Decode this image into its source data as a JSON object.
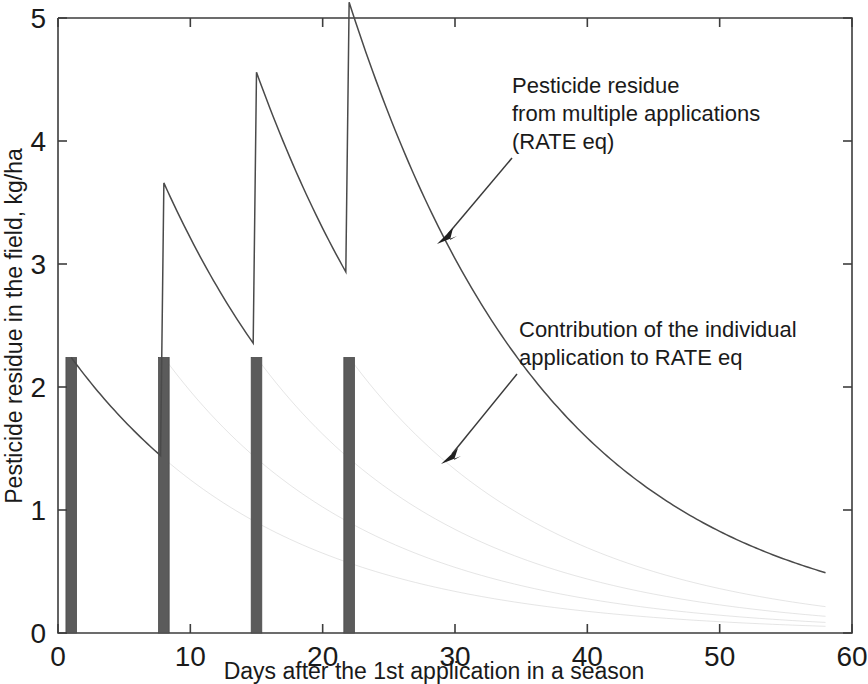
{
  "chart_data": {
    "type": "line",
    "title": "",
    "xlabel": "Days after the 1st application in a season",
    "ylabel": "Pesticide residue in the field, kg/ha",
    "xlim": [
      0,
      60
    ],
    "ylim": [
      0,
      5
    ],
    "xticks": [
      0,
      10,
      20,
      30,
      40,
      50,
      60
    ],
    "yticks": [
      0,
      1,
      2,
      3,
      4,
      5
    ],
    "grid": false,
    "legend_position": "none",
    "colors": {
      "bar": "#5b5b5b",
      "total_curve": "#4a4a4a",
      "contribution_curve": "#c9c9c9",
      "axis": "#3d3d3d",
      "text": "#1a1a1a"
    },
    "series": [
      {
        "name": "Pesticide residue from multiple applications (RATE eq)",
        "type": "line",
        "style": "solid",
        "decay_rate_per_day": 0.0652,
        "application_days": [
          1,
          8,
          15,
          22
        ],
        "application_amount": 2.24,
        "breakpoints": [
          {
            "x": 1,
            "y": 2.24,
            "label": "1st application peak"
          },
          {
            "x": 8,
            "y": 1.42,
            "label": "before 2nd application"
          },
          {
            "x": 8,
            "y": 3.55,
            "label": "2nd application peak"
          },
          {
            "x": 15,
            "y": 2.3,
            "label": "before 3rd application"
          },
          {
            "x": 15,
            "y": 4.33,
            "label": "3rd application peak"
          },
          {
            "x": 22,
            "y": 2.79,
            "label": "before 4th application"
          },
          {
            "x": 22,
            "y": 4.85,
            "label": "4th application peak"
          },
          {
            "x": 30,
            "y": 2.88,
            "label": "decay"
          },
          {
            "x": 40,
            "y": 1.5,
            "label": "decay"
          },
          {
            "x": 50,
            "y": 0.78,
            "label": "decay"
          },
          {
            "x": 58,
            "y": 0.36,
            "label": "end of series"
          }
        ]
      },
      {
        "name": "Contribution of the individual application to RATE eq",
        "type": "line",
        "style": "faint",
        "applications": [
          {
            "start_day": 1,
            "start_value": 2.24
          },
          {
            "start_day": 8,
            "start_value": 2.24
          },
          {
            "start_day": 15,
            "start_value": 2.24
          },
          {
            "start_day": 22,
            "start_value": 2.24
          }
        ]
      },
      {
        "name": "Application events",
        "type": "bar",
        "bar_days": [
          1,
          8,
          15,
          22
        ],
        "bar_values": [
          2.24,
          2.24,
          2.24,
          2.24
        ],
        "bar_width_days": 0.8
      }
    ],
    "annotations": [
      {
        "id": "annotation-multiple-applications",
        "lines": [
          "Pesticide residue",
          "from multiple applications",
          "(RATE eq)"
        ],
        "text_x_px": 512,
        "text_y_px": 93,
        "arrow_from_px": [
          512,
          152
        ],
        "arrow_to_px": [
          437,
          242
        ]
      },
      {
        "id": "annotation-individual-contribution",
        "lines": [
          "Contribution of the individual",
          "application to RATE eq"
        ],
        "text_x_px": 519,
        "text_y_px": 337,
        "arrow_from_px": [
          517,
          368
        ],
        "arrow_to_px": [
          443,
          462
        ]
      }
    ]
  },
  "axes": {
    "y_title": "Pesticide residue in the field, kg/ha",
    "x_title": "Days after the 1st application in a season",
    "y_tick_labels": [
      "0",
      "1",
      "2",
      "3",
      "4",
      "5"
    ],
    "x_tick_labels": [
      "0",
      "10",
      "20",
      "30",
      "40",
      "50",
      "60"
    ]
  },
  "annotations_text": {
    "multiple_line1": "Pesticide residue",
    "multiple_line2": "from multiple applications",
    "multiple_line3": "(RATE eq)",
    "individual_line1": "Contribution of the individual",
    "individual_line2": "application to RATE eq"
  }
}
